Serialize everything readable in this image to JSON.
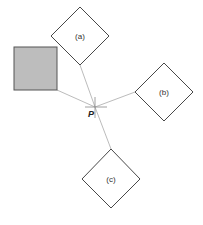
{
  "diagram": {
    "point": {
      "label": "P",
      "x": 95,
      "y": 107
    },
    "reference_square": {
      "x": 14,
      "y": 47,
      "width": 43,
      "height": 43,
      "fill": "#bdbdbd",
      "stroke": "#555555"
    },
    "diamonds": [
      {
        "id": "a",
        "label": "(a)",
        "cx": 80,
        "cy": 36,
        "r": 29
      },
      {
        "id": "b",
        "label": "(b)",
        "cx": 164,
        "cy": 92,
        "r": 29
      },
      {
        "id": "c",
        "label": "(c)",
        "cx": 111,
        "cy": 179,
        "r": 29
      }
    ],
    "connector_color": "#aaaaaa",
    "shape_stroke": "#333333"
  }
}
